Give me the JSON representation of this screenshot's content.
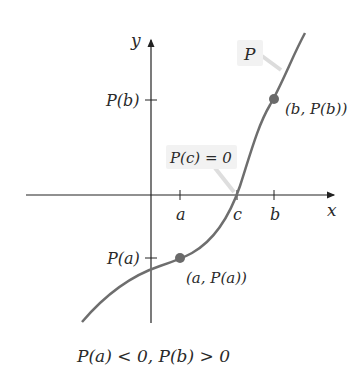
{
  "diagram": {
    "axes": {
      "x_label": "x",
      "y_label": "y"
    },
    "x_ticks": [
      {
        "label": "a",
        "x": 180
      },
      {
        "label": "c",
        "x": 237
      },
      {
        "label": "b",
        "x": 274
      }
    ],
    "y_ticks": [
      {
        "label": "P(b)",
        "y": 100
      },
      {
        "label": "P(a)",
        "y": 258
      }
    ],
    "curve_label": "P",
    "root_callout": "P(c) = 0",
    "points": [
      {
        "label": "(a, P(a))",
        "x": 180,
        "y": 258
      },
      {
        "label": "(b, P(b))",
        "x": 274,
        "y": 99
      }
    ],
    "caption": "P(a) < 0, P(b) > 0",
    "colors": {
      "curve": "#6e6e6e",
      "point": "#6a6a6a",
      "axis": "#222222",
      "callout_bg": "#f2f2f2",
      "text": "#2a2a2a"
    }
  }
}
